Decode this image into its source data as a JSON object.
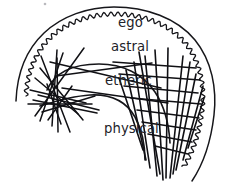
{
  "figure": {
    "background_color": "#ffffff",
    "ink_color": "#16161a",
    "label_color": "#222228",
    "width": 230,
    "height": 189
  },
  "labels": [
    {
      "id": "ego",
      "text": "ego",
      "x": 118,
      "y": 27,
      "size": 13.5
    },
    {
      "id": "astral",
      "text": "astral",
      "x": 111,
      "y": 51,
      "size": 13.5
    },
    {
      "id": "etheric",
      "text": "etheric",
      "x": 105,
      "y": 85,
      "size": 13.5
    },
    {
      "id": "physical",
      "text": "physical",
      "x": 104,
      "y": 133,
      "size": 13.5
    }
  ],
  "contours": {
    "ego_outer": {
      "name": "ego-outer-contour",
      "description": "smooth outer arc sweeping from lower-left up over the top and down the right side into a long tail",
      "path": "M 16 101 C 17 74 26 50 44 33 C 62 16 88 7 114 7 C 146 7 177 18 195 40 C 212 61 217 89 214 115 C 211 141 204 163 192 181",
      "stroke_width": 1.5
    },
    "astral_wavy": {
      "name": "astral-wavy-contour",
      "description": "scalloped wavy line inside the ego contour following the same sweep",
      "stroke_width": 1.3,
      "wave": {
        "amplitude": 2.1,
        "period": 7.0,
        "path": "M 26 96 C 27 72 36 51 52 36 C 69 21 92 14 115 14 C 143 14 170 24 186 44 C 201 63 205 88 202 111 C 199 134 193 152 183 168"
      }
    },
    "etheric_curve": {
      "name": "etheric-inner-curve",
      "description": "large inner hook curve from the left cluster arcing right and down to the lower right bundle",
      "path": "M 47 90 C 55 72 74 64 99 64 C 123 64 143 74 155 92 C 165 107 169 125 170 143",
      "stroke_width": 1.6
    },
    "physical_curve": {
      "name": "physical-inner-curve",
      "description": "smaller inner hook curve below the etheric curve, opening to the left",
      "path": "M 40 106 C 56 101 74 96 90 95 C 110 94 126 101 135 117 C 142 130 145 146 145 160",
      "stroke_width": 1.6
    }
  },
  "ray_bundles": [
    {
      "id": "left-bundle",
      "name": "left-ray-bundle",
      "hub": {
        "x": 54,
        "y": 95
      },
      "description": "cluster of straight rays crossing near the left of the etheric curve",
      "stroke_width": 1.5
    },
    {
      "id": "right-bundle",
      "name": "right-ray-bundle",
      "hub": {
        "x": 166,
        "y": 122
      },
      "description": "dense converging bundle of straight rays at the lower right, fanning up and left",
      "stroke_width": 1.6
    }
  ],
  "rays": {
    "left": [
      "M 57 50 L 52 126",
      "M 41 56 L 70 132",
      "M 63 53 L 40 121",
      "M 35 78 L 78 114",
      "M 30 90 L 86 103",
      "M 28 104 L 92 104",
      "M 40 68 L 83 120",
      "M 84 48 L 35 116",
      "M 33 100 L 97 113",
      "M 42 112 L 95 96",
      "M 48 120 L 72 86",
      "M 61 124 L 47 84",
      "M 38 95 L 99 110",
      "M 58 132 L 57 58"
    ],
    "spine": [
      "M 50 62 L 161 88",
      "M 56 76 L 152 63",
      "M 62 88 L 168 103"
    ],
    "right": [
      "M 163 180 L 155 50",
      "M 170 178 L 183 56",
      "M 157 176 L 145 56",
      "M 176 170 L 196 74",
      "M 150 168 L 134 62",
      "M 183 160 L 203 86",
      "M 146 160 L 126 70",
      "M 188 148 L 204 98",
      "M 143 150 L 119 78",
      "M 166 178 L 168 48",
      "M 160 174 L 139 52",
      "M 173 174 L 190 62",
      "M 119 74 L 200 80",
      "M 124 86 L 198 93",
      "M 131 98 L 201 104",
      "M 137 110 L 199 118",
      "M 142 122 L 196 130",
      "M 113 62 L 196 68",
      "M 148 134 L 192 142",
      "M 155 146 L 188 154"
    ]
  },
  "specks": [
    {
      "id": "speck-top",
      "x": 45,
      "y": 4,
      "r": 1.3
    }
  ]
}
